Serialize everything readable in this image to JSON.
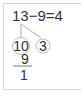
{
  "equation": {
    "text": "13−9=4",
    "minuend": "13",
    "operator": "−",
    "subtrahend": "9",
    "equals": "=",
    "result": "4"
  },
  "decomposition": {
    "left_part": "10",
    "right_part": "3"
  },
  "vertical_subtraction": {
    "top": "10",
    "subtract": "9",
    "result": "1"
  },
  "colors": {
    "text": "#333333",
    "lines": "#999999",
    "circles": "#aaaaaa",
    "frame": "#d9d9d9"
  }
}
